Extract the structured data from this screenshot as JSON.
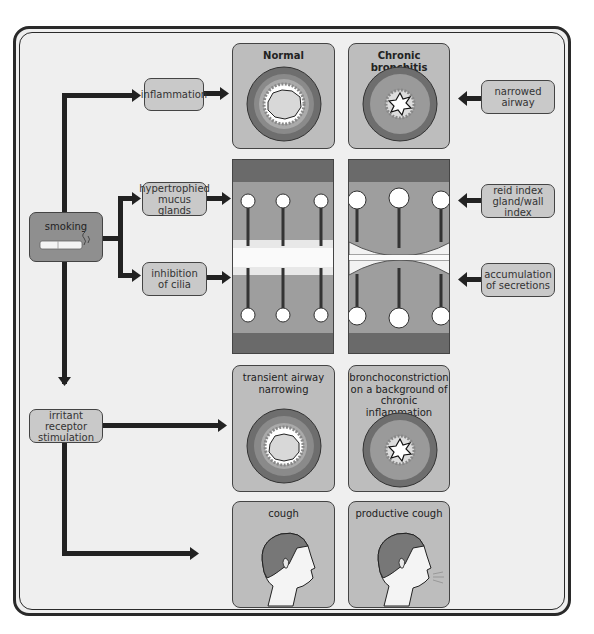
{
  "diagram": {
    "columns": {
      "normal": "Normal",
      "chronic": "Chronic bronchitis"
    },
    "cause": {
      "label": "smoking",
      "icon": "cigarette-icon"
    },
    "left_nodes": {
      "inflammation": "inflammation",
      "hypertrophied": [
        "hypertrophied",
        "mucus glands"
      ],
      "cilia": [
        "inhibition",
        "of cilia"
      ],
      "irritant": [
        "irritant receptor",
        "stimulation"
      ]
    },
    "right_nodes": {
      "narrowed": [
        "narrowed",
        "airway"
      ],
      "reid": [
        "reid index",
        "gland/wall index"
      ],
      "accumulation": [
        "accumulation",
        "of secretions"
      ]
    },
    "panels": {
      "transient": [
        "transient airway",
        "narrowing"
      ],
      "broncho": [
        "bronchoconstriction",
        "on a background of",
        "chronic inflammation"
      ],
      "cough": "cough",
      "productive": "productive cough"
    },
    "colors": {
      "frame_bg": "#efefef",
      "node_bg": "#c9c9c9",
      "panel_bg": "#bdbdbd",
      "smoking_bg": "#8f8f8f",
      "arrow": "#222222"
    }
  }
}
